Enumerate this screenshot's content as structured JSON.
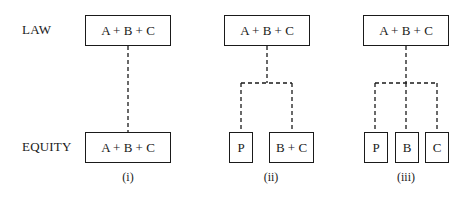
{
  "row_labels": {
    "law": "LAW",
    "equity": "EQUITY"
  },
  "diagrams": [
    {
      "caption": "(i)",
      "law_box": "A + B + C",
      "equity_boxes": [
        "A + B + C"
      ]
    },
    {
      "caption": "(ii)",
      "law_box": "A + B + C",
      "equity_boxes": [
        "P",
        "B + C"
      ]
    },
    {
      "caption": "(iii)",
      "law_box": "A + B + C",
      "equity_boxes": [
        "P",
        "B",
        "C"
      ]
    }
  ],
  "colors": {
    "line": "#1a1a1a",
    "background": "#ffffff"
  }
}
